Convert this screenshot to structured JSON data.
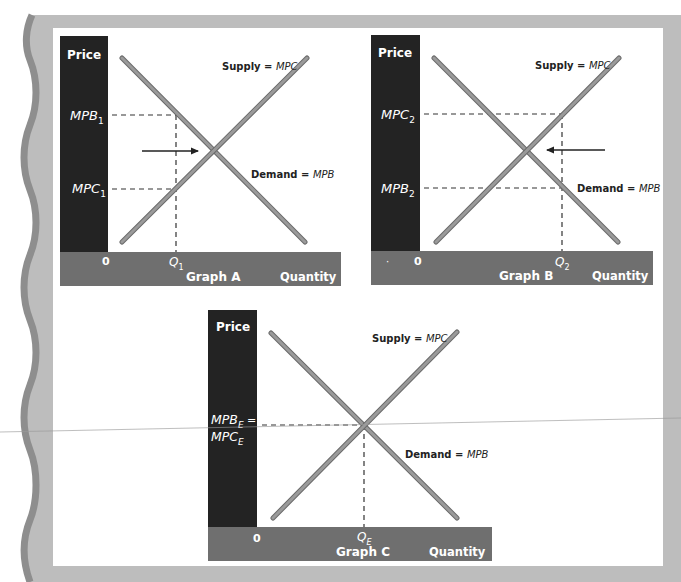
{
  "colors": {
    "frame_gray": "#b9b9b9",
    "wave_dark": "#8e8e8e",
    "panel": "#ffffff",
    "price_bar": "#232323",
    "quantity_bar": "#6f6f6f",
    "curve": "#8a8a8a",
    "curve_edge": "#6a6a6a",
    "dash": "#333333",
    "arrow": "#222222"
  },
  "graphs": [
    {
      "id": "A",
      "caption": "Graph A",
      "y_axis_label": "Price",
      "x_axis_label": "Quantity",
      "origin_label": "0",
      "supply_label_main": "Supply = ",
      "supply_label_italic": "MPC",
      "demand_label_main": "Demand = ",
      "demand_label_italic": "MPB",
      "price_levels": [
        {
          "base": "MPB",
          "sub": "1",
          "position": "upper"
        },
        {
          "base": "MPC",
          "sub": "1",
          "position": "lower"
        }
      ],
      "quantity_level": {
        "base": "Q",
        "sub": "1"
      },
      "arrow_direction": "right"
    },
    {
      "id": "B",
      "caption": "Graph B",
      "y_axis_label": "Price",
      "x_axis_label": "Quantity",
      "origin_label": "0",
      "origin_dot": "·",
      "supply_label_main": "Supply = ",
      "supply_label_italic": "MPC",
      "demand_label_main": "Demand = ",
      "demand_label_italic": "MPB",
      "price_levels": [
        {
          "base": "MPC",
          "sub": "2",
          "position": "upper"
        },
        {
          "base": "MPB",
          "sub": "2",
          "position": "lower"
        }
      ],
      "quantity_level": {
        "base": "Q",
        "sub": "2"
      },
      "arrow_direction": "left"
    },
    {
      "id": "C",
      "caption": "Graph C",
      "y_axis_label": "Price",
      "x_axis_label": "Quantity",
      "origin_label": "0",
      "supply_label_main": "Supply = ",
      "supply_label_italic": "MPC",
      "demand_label_main": "Demand = ",
      "demand_label_italic": "MPB",
      "price_levels": [
        {
          "base": "MPB",
          "sub": "E",
          "suffix": " =",
          "position": "equilibrium-line1"
        },
        {
          "base": "MPC",
          "sub": "E",
          "position": "equilibrium-line2"
        }
      ],
      "quantity_level": {
        "base": "Q",
        "sub": "E"
      },
      "arrow_direction": "none"
    }
  ]
}
